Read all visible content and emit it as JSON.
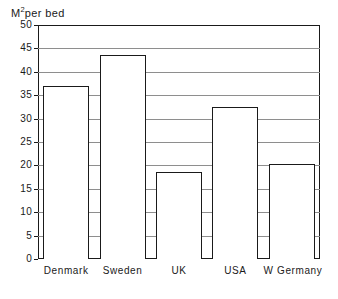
{
  "chart_data": {
    "type": "bar",
    "title": "",
    "xlabel": "",
    "ylabel": "M2 per bed",
    "ylabel_prefix": "M",
    "ylabel_superscript": "2",
    "ylabel_suffix": "per bed",
    "categories": [
      "Denmark",
      "Sweden",
      "UK",
      "USA",
      "W Germany"
    ],
    "values": [
      37.0,
      43.5,
      18.6,
      32.5,
      20.2
    ],
    "ylim": [
      0,
      50
    ],
    "ytick_step": 5,
    "yticks": [
      0,
      5,
      10,
      15,
      20,
      25,
      30,
      35,
      40,
      45,
      50
    ],
    "ytick_labels": [
      "0",
      "5",
      "10",
      "15",
      "20",
      "25",
      "30",
      "35",
      "40",
      "45",
      "50"
    ],
    "grid": true,
    "grid_axis": "y",
    "legend": false,
    "legend_position": "none",
    "bar_fill_color": "#ffffff",
    "bar_edge_color": "#1a1a1a",
    "grid_color": "#8e8e8e",
    "axis_color": "#1a1a1a",
    "background_color": "#ffffff"
  }
}
